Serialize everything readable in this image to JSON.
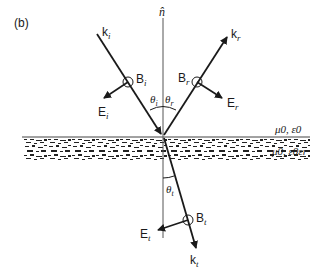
{
  "figure": {
    "panel_label": "(b)",
    "normal_label": "n̂",
    "incident": {
      "wave_vector": "k",
      "wave_sub": "i",
      "b_field": "B",
      "b_sub": "i",
      "e_field": "E",
      "e_sub": "i",
      "angle": "θ",
      "angle_sub": "i"
    },
    "reflected": {
      "wave_vector": "k",
      "wave_sub": "r",
      "b_field": "B",
      "b_sub": "r",
      "e_field": "E",
      "e_sub": "r",
      "angle": "θ",
      "angle_sub": "r"
    },
    "transmitted": {
      "wave_vector": "k",
      "wave_sub": "t",
      "b_field": "B",
      "b_sub": "t",
      "e_field": "E",
      "e_sub": "t",
      "angle": "θ",
      "angle_sub": "t"
    },
    "medium_upper": "μ0, ε0",
    "medium_lower": "μ0, ε0εr"
  }
}
